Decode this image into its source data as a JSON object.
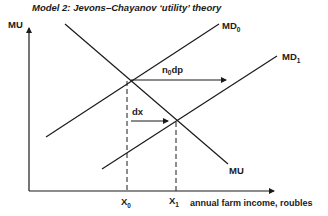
{
  "title": "Model 2: Jevons–Chayanov ‘utility’ theory",
  "axes": {
    "y_label": "MU",
    "x_label": "annual farm income, roubles"
  },
  "curves": {
    "mu": {
      "label": "MU"
    },
    "md0": {
      "label_main": "MD",
      "label_sub": "0"
    },
    "md1": {
      "label_main": "MD",
      "label_sub": "1"
    }
  },
  "points": {
    "x0": {
      "label_main": "X",
      "label_sub": "0"
    },
    "x1": {
      "label_main": "X",
      "label_sub": "1"
    }
  },
  "arrows": {
    "shift": {
      "label_pre": "n",
      "label_sub": "0",
      "label_post": "dp"
    },
    "dx": {
      "label": "dx"
    }
  },
  "colors": {
    "ink": "#1a1a1a",
    "background": "#ffffff"
  }
}
